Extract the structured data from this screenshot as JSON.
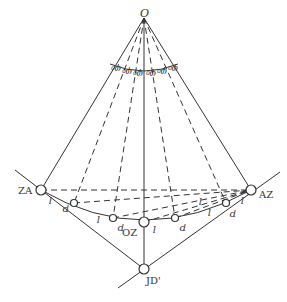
{
  "diagram": {
    "orientation": "rotated-180",
    "apex": {
      "label": "O",
      "x": 144,
      "y": 18
    },
    "left_point": {
      "label": "ZA",
      "x": 41,
      "y": 190
    },
    "right_point": {
      "label": "AZ",
      "x": 251,
      "y": 190
    },
    "bottom_point": {
      "label": "JD'",
      "x": 144,
      "y": 269
    },
    "center_point": {
      "label": "OZ",
      "x": 144,
      "y": 222
    },
    "angle_label": "φ₀",
    "angle_count": 6,
    "curve_labels": [
      "l",
      "l",
      "l",
      "l",
      "l",
      "l"
    ],
    "points": [
      {
        "label": "p",
        "x": 74,
        "y": 203
      },
      {
        "label": "p",
        "x": 113,
        "y": 218
      },
      {
        "label": "p",
        "x": 175,
        "y": 218
      },
      {
        "label": "p",
        "x": 226,
        "y": 203
      }
    ],
    "line_color": "#333333"
  }
}
